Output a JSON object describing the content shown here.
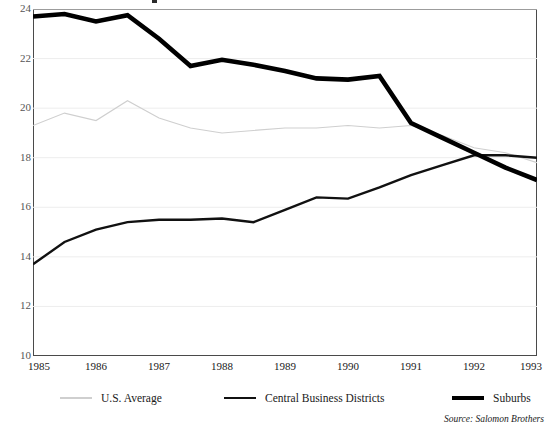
{
  "chart_data": {
    "type": "line",
    "title": "",
    "xlabel": "",
    "ylabel": "",
    "x": [
      1985,
      1986,
      1987,
      1988,
      1989,
      1990,
      1991,
      1992,
      1993
    ],
    "xlim": [
      1985,
      1993
    ],
    "ylim": [
      10,
      24
    ],
    "ytick_labels": [
      "10",
      "12",
      "14",
      "16",
      "18",
      "20",
      "22",
      "24"
    ],
    "yticks": [
      10,
      12,
      14,
      16,
      18,
      20,
      22,
      24
    ],
    "xtick_labels": [
      "1985",
      "1986",
      "1987",
      "1988",
      "1989",
      "1990",
      "1991",
      "1992",
      "1993"
    ],
    "grid": "horizontal",
    "legend_position": "below-axis",
    "series": [
      {
        "name": "U.S. Average",
        "color": "#cfcfcf",
        "width": 1.1,
        "x": [
          1985,
          1985.5,
          1986,
          1986.5,
          1987,
          1987.5,
          1988,
          1988.5,
          1989,
          1989.5,
          1990,
          1990.5,
          1991,
          1991.5,
          1992,
          1992.5,
          1993
        ],
        "values": [
          19.3,
          19.8,
          19.5,
          20.3,
          19.6,
          19.2,
          19.0,
          19.1,
          19.2,
          19.2,
          19.3,
          19.2,
          19.3,
          18.9,
          18.4,
          18.2,
          17.8
        ]
      },
      {
        "name": "Central Business Districts",
        "color": "#111111",
        "width": 2.4,
        "x": [
          1985,
          1985.5,
          1986,
          1986.5,
          1987,
          1987.5,
          1988,
          1988.5,
          1989,
          1989.5,
          1990,
          1990.5,
          1991,
          1991.5,
          1992,
          1992.5,
          1993
        ],
        "values": [
          13.7,
          14.6,
          15.1,
          15.4,
          15.5,
          15.5,
          15.55,
          15.4,
          15.9,
          16.4,
          16.35,
          16.8,
          17.3,
          17.7,
          18.1,
          18.1,
          18.0
        ]
      },
      {
        "name": "Suburbs",
        "color": "#000000",
        "width": 4.6,
        "x": [
          1985,
          1985.5,
          1986,
          1986.5,
          1987,
          1987.5,
          1988,
          1988.5,
          1989,
          1989.5,
          1990,
          1990.5,
          1991,
          1991.5,
          1992,
          1992.5,
          1993
        ],
        "values": [
          23.7,
          23.8,
          23.5,
          23.75,
          22.8,
          21.7,
          21.95,
          21.75,
          21.5,
          21.2,
          21.15,
          21.3,
          19.4,
          18.8,
          18.2,
          17.6,
          17.1
        ]
      }
    ],
    "source": "Source: Salomon Brothers"
  },
  "legend": {
    "items": [
      {
        "label": "U.S. Average"
      },
      {
        "label": "Central Business Districts"
      },
      {
        "label": "Suburbs"
      }
    ]
  }
}
